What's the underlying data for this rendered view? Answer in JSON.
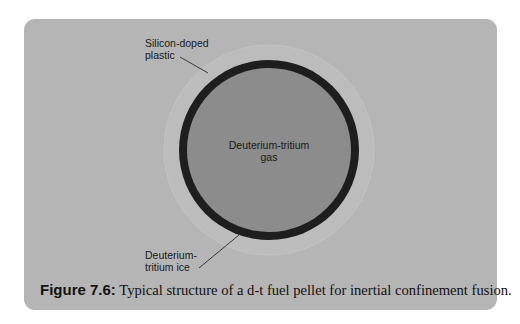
{
  "figure": {
    "caption_label": "Figure 7.6:",
    "caption_text": " Typical structure of a d-t fuel pellet for inertial confinement fusion."
  },
  "labels": {
    "outer_layer_line1": "Silicon-doped",
    "outer_layer_line2": "plastic",
    "core_line1": "Deuterium-tritium",
    "core_line2": "gas",
    "ice_line1": "Deuterium-",
    "ice_line2": "tritium ice"
  },
  "colors": {
    "panel": "#b5b5b5",
    "plastic_halo": "#bdbdbd",
    "ice_ring": "#1e1e1e",
    "gas_core": "#8c8c8c",
    "text": "#1a1a1a"
  },
  "geometry": {
    "center": [
      269,
      150
    ],
    "halo_radius": 105,
    "ice_outer_radius": 90,
    "ice_thickness": 8
  }
}
